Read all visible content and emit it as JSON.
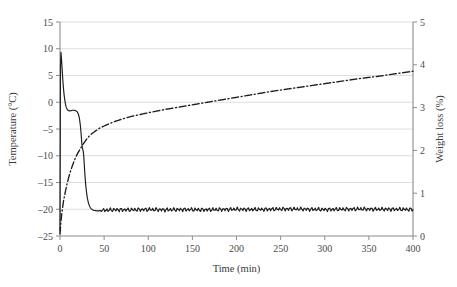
{
  "chart_data": {
    "type": "line",
    "title": "",
    "xlabel": "Time (min)",
    "ylabel": "Temperature (°C)",
    "y2label": "Weight loss (%)",
    "xlim": [
      0,
      400
    ],
    "ylim": [
      -25,
      15
    ],
    "y2lim": [
      0,
      5
    ],
    "grid": true,
    "legend": "none",
    "xticks": [
      0,
      50,
      100,
      150,
      200,
      250,
      300,
      350,
      400
    ],
    "xtick_labels": [
      "0",
      "50",
      "100",
      "150",
      "200",
      "250",
      "300",
      "350",
      "400"
    ],
    "yticks": [
      -25,
      -20,
      -15,
      -10,
      -5,
      0,
      5,
      10,
      15
    ],
    "ytick_labels": [
      "–25",
      "–20",
      "–15",
      "–10",
      "–5",
      "0",
      "5",
      "10",
      "15"
    ],
    "y2ticks": [
      0,
      1,
      2,
      3,
      4,
      5
    ],
    "y2tick_labels": [
      "0",
      "1",
      "2",
      "3",
      "4",
      "5"
    ],
    "series": [
      {
        "name": "Temperature",
        "axis": "left",
        "style": "solid",
        "color": "#1c1c1c",
        "x": [
          0,
          0.6,
          1.2,
          2,
          3,
          4,
          5,
          6,
          7,
          8,
          9,
          10,
          11,
          12,
          13,
          14,
          15,
          16,
          17,
          18,
          19,
          20,
          21,
          22,
          23,
          24,
          24.5,
          25,
          25.5,
          26,
          26.5,
          27,
          27.5,
          28,
          29,
          30,
          31,
          32,
          33,
          34,
          35,
          36,
          37,
          38,
          40,
          42,
          44,
          46,
          48,
          50,
          60,
          80,
          100,
          120,
          140,
          160,
          180,
          200,
          220,
          240,
          260,
          280,
          300,
          320,
          340,
          360,
          380,
          400
        ],
        "y": [
          -24.0,
          9.6,
          9.3,
          7.4,
          4.6,
          2.4,
          0.9,
          -0.2,
          -0.9,
          -1.3,
          -1.5,
          -1.6,
          -1.6,
          -1.6,
          -1.55,
          -1.5,
          -1.5,
          -1.5,
          -1.55,
          -1.6,
          -1.7,
          -1.9,
          -2.3,
          -3.0,
          -4.2,
          -6.0,
          -7.2,
          -8.3,
          -8.7,
          -8.9,
          -9.3,
          -10.2,
          -11.6,
          -13.0,
          -15.2,
          -16.8,
          -17.9,
          -18.7,
          -19.2,
          -19.6,
          -19.85,
          -20.0,
          -20.1,
          -20.2,
          -20.25,
          -20.3,
          -20.3,
          -20.25,
          -20.2,
          -20.2,
          -20.1,
          -20.1,
          -20.05,
          -20.1,
          -20.05,
          -20.1,
          -20.05,
          -20.0,
          -20.05,
          -20.0,
          -19.95,
          -20.0,
          -20.05,
          -20.0,
          -19.95,
          -20.0,
          -20.0,
          -20.05
        ],
        "noise_band": {
          "start_x": 44,
          "end_x": 400,
          "amplitude": 0.32,
          "period": 4.0
        },
        "notes": "Cooling curve: initial ~9.6 °C, supercooling plateau near −1.5 °C from ~8–20 min, arrest near −8.5 °C at ~25 min, then fall to a noisy plateau at ≈−20 °C"
      },
      {
        "name": "Weight loss",
        "axis": "right",
        "style": "dash-dot",
        "color": "#1c1c1c",
        "x": [
          0,
          1,
          2,
          4,
          6,
          8,
          10,
          12,
          14,
          16,
          18,
          20,
          22,
          24,
          26,
          28,
          30,
          33,
          36,
          40,
          45,
          50,
          60,
          70,
          80,
          100,
          120,
          140,
          160,
          180,
          200,
          220,
          240,
          260,
          280,
          300,
          320,
          340,
          360,
          380,
          400
        ],
        "y": [
          0.05,
          0.32,
          0.52,
          0.82,
          1.03,
          1.22,
          1.38,
          1.52,
          1.64,
          1.75,
          1.85,
          1.93,
          2.0,
          2.07,
          2.14,
          2.2,
          2.26,
          2.33,
          2.39,
          2.45,
          2.52,
          2.57,
          2.66,
          2.73,
          2.79,
          2.88,
          2.96,
          3.03,
          3.1,
          3.17,
          3.24,
          3.31,
          3.38,
          3.44,
          3.5,
          3.56,
          3.62,
          3.68,
          3.73,
          3.79,
          3.85
        ],
        "notes": "Monotonic sublimation weight-loss curve rising from ~0 % to ~3.85 % at 400 min"
      }
    ]
  }
}
